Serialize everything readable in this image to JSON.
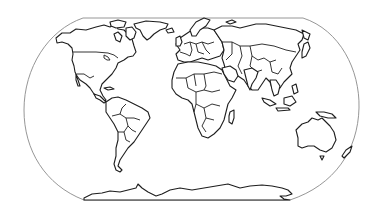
{
  "map": {
    "type": "world-outline",
    "projection": "robinson-like",
    "style": "black line-art outline, no labels",
    "colors": {
      "background": "#ffffff",
      "frame": "#8a8a8a",
      "coast": "#1e1e1e"
    },
    "regions": [
      {
        "name": "North America"
      },
      {
        "name": "Greenland"
      },
      {
        "name": "South America"
      },
      {
        "name": "Europe"
      },
      {
        "name": "Africa"
      },
      {
        "name": "Madagascar"
      },
      {
        "name": "Asia"
      },
      {
        "name": "Japan"
      },
      {
        "name": "Indonesia"
      },
      {
        "name": "Australia"
      },
      {
        "name": "New Zealand"
      },
      {
        "name": "Antarctica"
      }
    ]
  }
}
